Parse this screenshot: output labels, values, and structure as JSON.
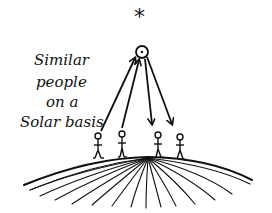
{
  "diagram": {
    "caption_lines": [
      "Similar",
      "people",
      "on a",
      "Solar basis"
    ],
    "top_symbol": "*",
    "sun_label": "sun-circle",
    "figures_count": 4,
    "arrows": [
      {
        "from": "figure-1",
        "to": "sun",
        "direction": "up"
      },
      {
        "from": "figure-2",
        "to": "sun",
        "direction": "up"
      },
      {
        "from": "sun",
        "to": "figure-3",
        "direction": "down"
      },
      {
        "from": "sun",
        "to": "figure-4",
        "direction": "down"
      }
    ],
    "ink_color": "#111111",
    "background_color": "#ffffff"
  }
}
